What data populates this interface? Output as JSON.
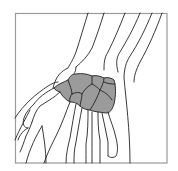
{
  "figure": {
    "highlighted_region": "carpal bones",
    "colors": {
      "background": "#ffffff",
      "frame": "#9a9a9a",
      "outline": "#222222",
      "carpal_fill": "#9b9b9b"
    }
  }
}
